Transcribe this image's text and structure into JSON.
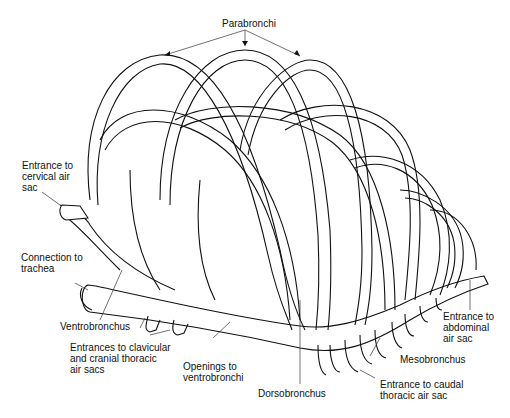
{
  "figure": {
    "labels": {
      "parabronchi": "Parabronchi",
      "cervical": "Entrance to\ncervical air\nsac",
      "trachea": "Connection to\ntrachea",
      "ventrobronchus": "Ventrobronchus",
      "clavicular": "Entrances to clavicular\nand cranial thoracic\nair sacs",
      "openings": "Openings to\nventrobronchi",
      "dorsobronchus": "Dorsobronchus",
      "caudal": "Entrance to caudal\nthoracic air sac",
      "mesobronchus": "Mesobronchus",
      "abdominal": "Entrance to\nabdominal\nair sac"
    }
  }
}
